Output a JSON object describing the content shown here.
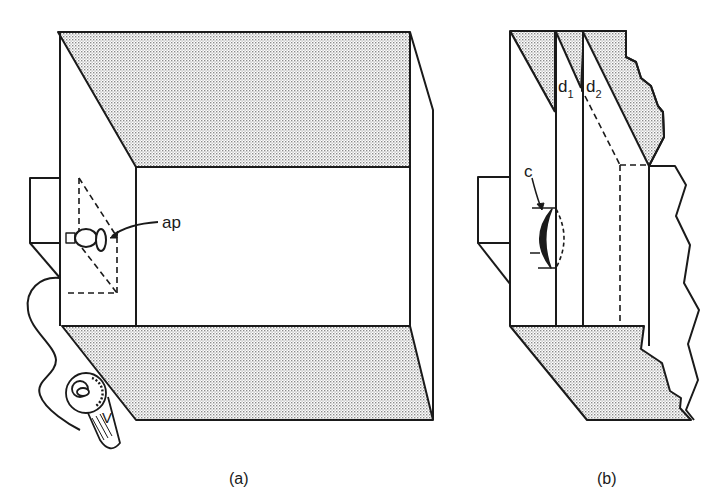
{
  "figure": {
    "panel_a": {
      "caption": "(a)",
      "labels": {
        "aperture": "ap",
        "voltage": "V"
      },
      "parts": [
        "lamp-housing",
        "lamp-bulb",
        "aperture",
        "light-cone",
        "power-cable",
        "variable-transformer",
        "box-top-wall",
        "box-back-wall",
        "box-floor",
        "box-right-wall"
      ]
    },
    "panel_b": {
      "caption": "(b)",
      "labels": {
        "condenser": "c",
        "d1_main": "d",
        "d1_sub": "1",
        "d2_main": "d",
        "d2_sub": "2"
      },
      "parts": [
        "lamp-housing",
        "condenser-lens",
        "divider-1",
        "divider-2",
        "torn-top-wall",
        "torn-floor",
        "torn-right-edge"
      ]
    },
    "colors": {
      "line": "#1a1a1a",
      "stipple": "#b8b8b8",
      "background": "#ffffff"
    }
  }
}
